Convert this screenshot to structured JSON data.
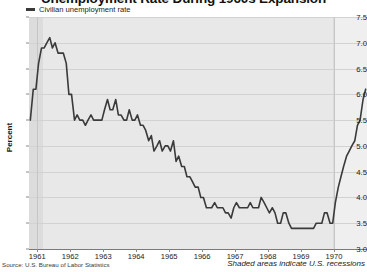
{
  "chart_data": {
    "type": "line",
    "title": "Unemployment Rate During 1960s Expansion",
    "xlabel": "",
    "ylabel": "Percent",
    "ylim": [
      3.0,
      7.5
    ],
    "xlim": [
      1960.75,
      1971.0
    ],
    "grid": true,
    "legend_position": "top-left",
    "source": "Source: U.S. Bureau of Labor Statistics",
    "note": "Shaded areas indicate U.S. recessions",
    "ytick_labels": [
      "7.5",
      "7.0",
      "6.5",
      "6.0",
      "5.5",
      "5.0",
      "4.5",
      "4.0",
      "3.5",
      "3.0"
    ],
    "ytick_values": [
      7.5,
      7.0,
      6.5,
      6.0,
      5.5,
      5.0,
      4.5,
      4.0,
      3.5,
      3.0
    ],
    "xtick_labels": [
      "1961",
      "1962",
      "1963",
      "1964",
      "1965",
      "1966",
      "1967",
      "1968",
      "1969",
      "1970"
    ],
    "xtick_values": [
      1961,
      1962,
      1963,
      1964,
      1965,
      1966,
      1967,
      1968,
      1969,
      1970
    ],
    "series": [
      {
        "name": "Civilian unemployment rate",
        "color": "#3a3a3a",
        "x": [
          1960.79,
          1960.88,
          1960.96,
          1961.04,
          1961.13,
          1961.21,
          1961.29,
          1961.38,
          1961.46,
          1961.54,
          1961.63,
          1961.71,
          1961.79,
          1961.88,
          1961.96,
          1962.04,
          1962.13,
          1962.21,
          1962.29,
          1962.38,
          1962.46,
          1962.54,
          1962.63,
          1962.71,
          1962.79,
          1962.88,
          1962.96,
          1963.04,
          1963.13,
          1963.21,
          1963.29,
          1963.38,
          1963.46,
          1963.54,
          1963.63,
          1963.71,
          1963.79,
          1963.88,
          1963.96,
          1964.04,
          1964.13,
          1964.21,
          1964.29,
          1964.38,
          1964.46,
          1964.54,
          1964.63,
          1964.71,
          1964.79,
          1964.88,
          1964.96,
          1965.04,
          1965.13,
          1965.21,
          1965.29,
          1965.38,
          1965.46,
          1965.54,
          1965.63,
          1965.71,
          1965.79,
          1965.88,
          1965.96,
          1966.04,
          1966.13,
          1966.21,
          1966.29,
          1966.38,
          1966.46,
          1966.54,
          1966.63,
          1966.71,
          1966.79,
          1966.88,
          1966.96,
          1967.04,
          1967.13,
          1967.21,
          1967.29,
          1967.38,
          1967.46,
          1967.54,
          1967.63,
          1967.71,
          1967.79,
          1967.88,
          1967.96,
          1968.04,
          1968.13,
          1968.21,
          1968.29,
          1968.38,
          1968.46,
          1968.54,
          1968.63,
          1968.71,
          1968.79,
          1968.88,
          1968.96,
          1969.04,
          1969.13,
          1969.21,
          1969.29,
          1969.38,
          1969.46,
          1969.54,
          1969.63,
          1969.71,
          1969.79,
          1969.88,
          1969.96,
          1970.04,
          1970.13,
          1970.21,
          1970.29,
          1970.38,
          1970.46,
          1970.54,
          1970.63,
          1970.71,
          1970.79,
          1970.88,
          1970.96
        ],
        "values": [
          5.5,
          6.1,
          6.1,
          6.6,
          6.9,
          6.9,
          7.0,
          7.1,
          6.9,
          7.0,
          6.8,
          6.8,
          6.8,
          6.6,
          6.0,
          6.0,
          5.5,
          5.6,
          5.5,
          5.5,
          5.4,
          5.5,
          5.6,
          5.5,
          5.5,
          5.5,
          5.5,
          5.7,
          5.9,
          5.7,
          5.7,
          5.9,
          5.6,
          5.6,
          5.5,
          5.5,
          5.7,
          5.5,
          5.5,
          5.6,
          5.4,
          5.4,
          5.3,
          5.1,
          5.2,
          4.9,
          5.0,
          5.1,
          4.9,
          5.0,
          5.0,
          4.9,
          5.1,
          4.7,
          4.8,
          4.6,
          4.6,
          4.4,
          4.4,
          4.3,
          4.2,
          4.2,
          4.0,
          4.0,
          3.8,
          3.8,
          3.8,
          3.9,
          3.8,
          3.8,
          3.8,
          3.7,
          3.7,
          3.6,
          3.8,
          3.9,
          3.8,
          3.8,
          3.8,
          3.8,
          3.9,
          3.8,
          3.8,
          3.8,
          4.0,
          3.9,
          3.8,
          3.7,
          3.8,
          3.7,
          3.5,
          3.5,
          3.7,
          3.7,
          3.5,
          3.4,
          3.4,
          3.4,
          3.4,
          3.4,
          3.4,
          3.4,
          3.4,
          3.4,
          3.5,
          3.5,
          3.5,
          3.7,
          3.7,
          3.5,
          3.5,
          3.9,
          4.2,
          4.4,
          4.6,
          4.8,
          4.9,
          5.0,
          5.1,
          5.4,
          5.5,
          5.9,
          6.1
        ]
      }
    ],
    "recession_bands": [
      {
        "start": 1960.75,
        "end": 1961.17,
        "label": "1960-61 recession"
      },
      {
        "start": 1969.96,
        "end": 1971.0,
        "label": "1969-70 recession"
      }
    ]
  }
}
